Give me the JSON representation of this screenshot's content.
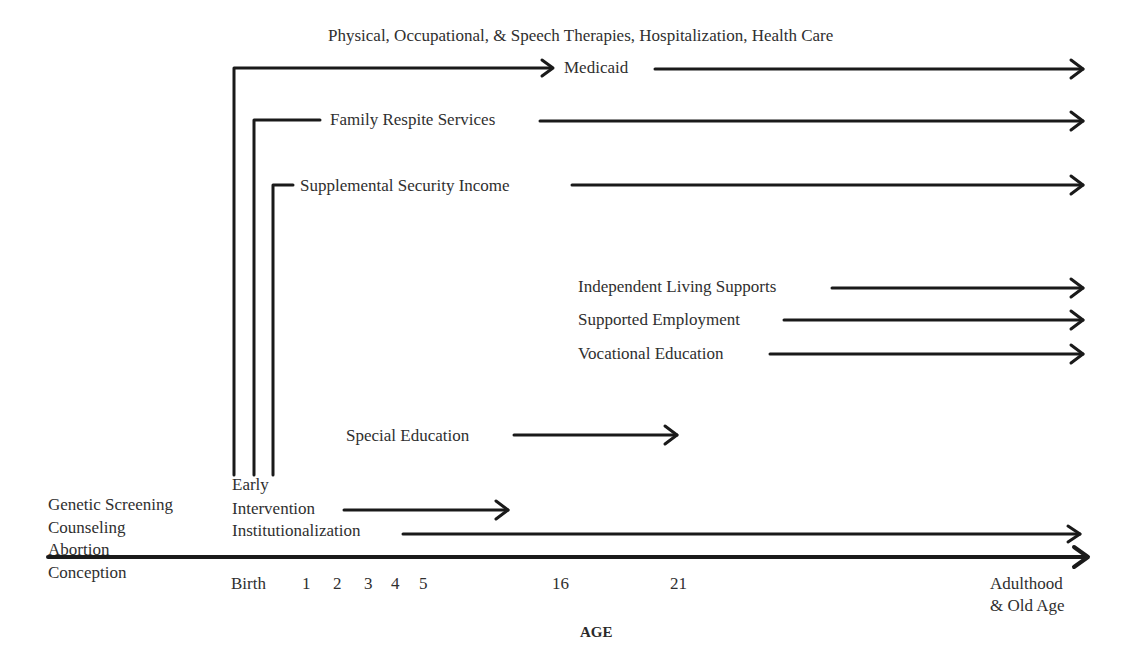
{
  "diagram": {
    "header": "Physical, Occupational, & Speech Therapies, Hospitalization, Health Care",
    "services": {
      "medicaid": "Medicaid",
      "family_respite": "Family Respite Services",
      "ssi": "Supplemental Security Income",
      "independent_living": "Independent Living Supports",
      "supported_employment": "Supported Employment",
      "vocational_education": "Vocational Education",
      "special_education": "Special Education",
      "early_intervention_line1": "Early",
      "early_intervention_line2": "Intervention",
      "institutionalization": "Institutionalization"
    },
    "prenatal": {
      "line1": "Genetic Screening",
      "line2": "Counseling",
      "line3": "Abortion",
      "line4": "Conception"
    },
    "axis": {
      "title": "AGE",
      "ticks": [
        "Birth",
        "1",
        "2",
        "3",
        "4",
        "5",
        "16",
        "21"
      ],
      "end_label_line1": "Adulthood",
      "end_label_line2": "& Old Age"
    },
    "colors": {
      "line": "#1a1a1a",
      "text": "#2f2f2f"
    }
  }
}
